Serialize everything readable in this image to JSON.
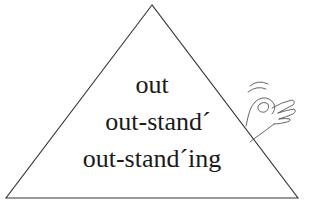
{
  "diagram": {
    "shape": "triangle",
    "stroke_color": "#333333",
    "background": "#ffffff",
    "lines": [
      {
        "text": "out"
      },
      {
        "text": "out-stand´"
      },
      {
        "text": "out-stand´ing"
      }
    ],
    "decoration": {
      "icon": "ok-hand-gesture-icon"
    }
  }
}
